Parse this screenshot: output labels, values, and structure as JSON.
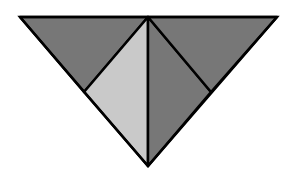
{
  "diagram": {
    "title": "",
    "colors": {
      "background": "#ffffff",
      "dark_fill": "#777777",
      "light_fill": "#c9c9c9",
      "stroke": "#000000"
    },
    "stroke_width": 2.5,
    "vertices": {
      "top_left": [
        20,
        17
      ],
      "top_center": [
        148,
        17
      ],
      "top_right": [
        277,
        17
      ],
      "left_mid": [
        84,
        92
      ],
      "right_mid": [
        211,
        92
      ],
      "bottom": [
        148,
        166
      ]
    },
    "shapes": [
      {
        "name": "top-left-triangle",
        "points": "20,17 148,17 84,92",
        "fill": "#777777"
      },
      {
        "name": "left-center-triangle",
        "points": "84,92 148,17 148,166",
        "fill": "#c9c9c9"
      },
      {
        "name": "right-center-triangle",
        "points": "148,17 211,92 148,166",
        "fill": "#777777"
      },
      {
        "name": "top-right-triangle",
        "points": "148,17 277,17 211,92",
        "fill": "#777777"
      }
    ]
  }
}
